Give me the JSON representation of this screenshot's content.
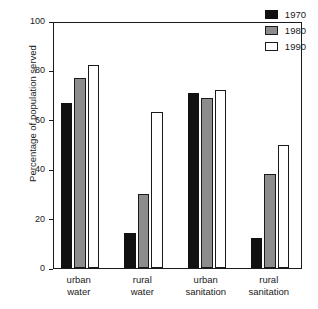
{
  "chart_data": {
    "type": "bar",
    "title": "",
    "xlabel": "",
    "ylabel": "Percentage of population served",
    "ylim": [
      0,
      100
    ],
    "yticks": [
      0,
      20,
      40,
      60,
      80,
      100
    ],
    "ytick_labels": [
      "0",
      "20",
      "40",
      "60",
      "80",
      "100"
    ],
    "grid": false,
    "legend_position": "top-right",
    "categories": [
      "urban water",
      "rural water",
      "urban sanitation",
      "rural sanitation"
    ],
    "category_lines": [
      [
        "urban",
        "water"
      ],
      [
        "rural",
        "water"
      ],
      [
        "urban",
        "sanitation"
      ],
      [
        "rural",
        "sanitation"
      ]
    ],
    "series": [
      {
        "name": "1970",
        "color": "#111111",
        "values": [
          67,
          14,
          71,
          12
        ]
      },
      {
        "name": "1980",
        "color": "#8c8c8c",
        "values": [
          77,
          30,
          69,
          38
        ]
      },
      {
        "name": "1990",
        "color": "#ffffff",
        "values": [
          82,
          63,
          72,
          50
        ]
      }
    ]
  },
  "legend": {
    "entries": [
      {
        "label": "1970"
      },
      {
        "label": "1980"
      },
      {
        "label": "1990"
      }
    ]
  },
  "colors": {
    "axis": "#1a1a1a",
    "series_1970": "#111111",
    "series_1980": "#8c8c8c",
    "series_1990": "#ffffff",
    "background": "#ffffff"
  }
}
